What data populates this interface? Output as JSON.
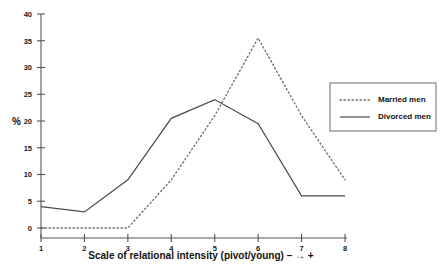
{
  "chart_data": {
    "type": "line",
    "title": "",
    "xlabel": "Scale of relational intensity (pivot/young) – → +",
    "ylabel": "%",
    "categories": [
      "1",
      "2",
      "3",
      "4",
      "5",
      "6",
      "7",
      "8"
    ],
    "x": [
      1,
      2,
      3,
      4,
      5,
      6,
      7,
      8
    ],
    "xlim": [
      1,
      8
    ],
    "ylim": [
      0,
      40
    ],
    "yticks": [
      0,
      5,
      10,
      15,
      20,
      25,
      30,
      35,
      40
    ],
    "ytick_labels": [
      "0",
      "5",
      "10",
      "15",
      "20",
      "25",
      "30",
      "35",
      "40"
    ],
    "xticks": [
      1,
      2,
      3,
      4,
      5,
      6,
      7,
      8
    ],
    "xtick_labels": [
      "1",
      "2",
      "3",
      "4",
      "5",
      "6",
      "7",
      "8"
    ],
    "grid": false,
    "legend_position": "right",
    "series": [
      {
        "name": "Married men",
        "style": "dotted",
        "color": "#6a6a6a",
        "values": [
          0,
          0,
          0,
          9,
          21,
          35.5,
          21,
          9
        ]
      },
      {
        "name": "Divorced men",
        "style": "solid",
        "color": "#4a4a4a",
        "values": [
          4,
          3,
          9,
          20.5,
          24,
          19.5,
          6,
          6
        ]
      }
    ]
  },
  "legend": {
    "items": [
      {
        "label": "Married men",
        "style": "dotted"
      },
      {
        "label": "Divorced men",
        "style": "solid"
      }
    ]
  },
  "colors": {
    "axis": "#555555",
    "text": "#111111",
    "background": "#ffffff",
    "married": "#6a6a6a",
    "divorced": "#4a4a4a"
  }
}
